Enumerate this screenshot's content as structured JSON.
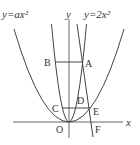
{
  "diagram": {
    "type": "coordinate-geometry",
    "labels": {
      "curve_wide": "y=ax²",
      "curve_narrow": "y=2x²",
      "y_axis": "y",
      "x_axis": "x",
      "origin": "O",
      "points": {
        "A": "A",
        "B": "B",
        "C": "C",
        "D": "D",
        "E": "E",
        "F": "F"
      }
    },
    "elements": {
      "parabola_wide": {
        "equation": "y=ax^2",
        "vertex": "O"
      },
      "parabola_narrow": {
        "equation": "y=2x^2",
        "vertex": "O"
      },
      "segment_BA": {
        "from": "B",
        "to": "A",
        "orientation": "horizontal"
      },
      "segment_CE": {
        "from": "C",
        "to": "E",
        "orientation": "horizontal"
      },
      "line_AF": {
        "through": [
          "A",
          "E",
          "F"
        ]
      }
    },
    "colors": {
      "stroke": "#444444",
      "text": "#333333",
      "background": "#ffffff"
    }
  }
}
